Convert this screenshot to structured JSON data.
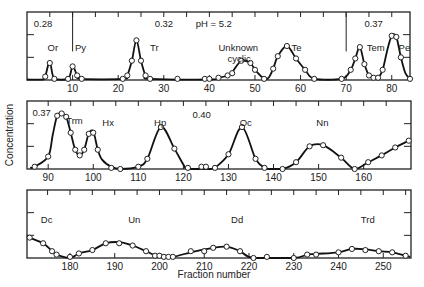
{
  "chart_data": {
    "type": "line",
    "title": "",
    "xlabel": "Fraction number",
    "ylabel": "Concentration",
    "grid": false,
    "panels": [
      {
        "xlim": [
          0,
          84
        ],
        "ylim": [
          0,
          3
        ],
        "box": {
          "x": 27,
          "y": 12,
          "w": 383,
          "h": 68
        },
        "xticks": [
          10,
          20,
          30,
          40,
          50,
          60,
          70,
          80
        ],
        "minor_ticks": [
          5,
          10,
          15,
          20,
          25,
          30,
          35,
          40,
          45,
          50,
          55,
          60,
          65,
          70,
          75,
          80
        ],
        "divider_lines": [
          {
            "x": 10,
            "label": "0.28",
            "label_x": 2
          },
          {
            "x": 70,
            "label": "0.37",
            "label_x": 72
          }
        ],
        "annotations": [
          {
            "text": "0.28",
            "x": 1.5,
            "y": 2.35
          },
          {
            "text": "0.32",
            "x": 28,
            "y": 2.35
          },
          {
            "text": "pH = 5.2",
            "x": 37,
            "y": 2.35
          },
          {
            "text": "Or",
            "x": 4.5,
            "y": 1.3
          },
          {
            "text": "Py",
            "x": 10.5,
            "y": 1.3
          },
          {
            "text": "Tr",
            "x": 27,
            "y": 1.3
          },
          {
            "text": "Unknown",
            "x": 42,
            "y": 1.3
          },
          {
            "text": "cyclic",
            "x": 44,
            "y": 0.8
          },
          {
            "text": "Te",
            "x": 58,
            "y": 1.3
          },
          {
            "text": "0.37",
            "x": 74,
            "y": 2.35
          },
          {
            "text": "Tem",
            "x": 74.5,
            "y": 1.3
          },
          {
            "text": "Pe",
            "x": 81.5,
            "y": 1.3
          }
        ],
        "points": [
          [
            4,
            0.15
          ],
          [
            5,
            0.75
          ],
          [
            6,
            0.05
          ],
          [
            9,
            0.05
          ],
          [
            10,
            0.6
          ],
          [
            11,
            0.2
          ],
          [
            12,
            0.05
          ],
          [
            21,
            0.05
          ],
          [
            22,
            0.2
          ],
          [
            23,
            0.85
          ],
          [
            24,
            1.75
          ],
          [
            25,
            0.85
          ],
          [
            26,
            0.2
          ],
          [
            27,
            0.05
          ],
          [
            33,
            0.05
          ],
          [
            39,
            0.05
          ],
          [
            40,
            0.05
          ],
          [
            42,
            0.1
          ],
          [
            44,
            0.2
          ],
          [
            45,
            0.3
          ],
          [
            47,
            0.85
          ],
          [
            49,
            0.75
          ],
          [
            50,
            0.45
          ],
          [
            52,
            0.05
          ],
          [
            54,
            0.5
          ],
          [
            55,
            1.05
          ],
          [
            57,
            1.5
          ],
          [
            59,
            0.95
          ],
          [
            61,
            0.45
          ],
          [
            63,
            0.05
          ],
          [
            69,
            0.05
          ],
          [
            71,
            0.45
          ],
          [
            72,
            0.95
          ],
          [
            73,
            1.45
          ],
          [
            74,
            0.7
          ],
          [
            75,
            0.2
          ],
          [
            76,
            0.1
          ],
          [
            77,
            0.1
          ],
          [
            78,
            0.45
          ],
          [
            80,
            1.95
          ],
          [
            81,
            1.9
          ],
          [
            82,
            1.0
          ],
          [
            84,
            0.05
          ]
        ],
        "curve": [
          [
            0,
            0.02
          ],
          [
            3.5,
            0.02
          ],
          [
            4,
            0.15
          ],
          [
            5,
            0.8
          ],
          [
            6,
            0.05
          ],
          [
            9,
            0.05
          ],
          [
            10,
            0.6
          ],
          [
            11,
            0.2
          ],
          [
            12,
            0.05
          ],
          [
            21,
            0.05
          ],
          [
            22,
            0.2
          ],
          [
            23,
            0.85
          ],
          [
            24,
            1.75
          ],
          [
            25,
            0.85
          ],
          [
            26,
            0.2
          ],
          [
            27,
            0.05
          ],
          [
            40,
            0.02
          ],
          [
            42,
            0.1
          ],
          [
            44,
            0.2
          ],
          [
            45,
            0.35
          ],
          [
            47,
            0.85
          ],
          [
            49,
            0.75
          ],
          [
            50,
            0.45
          ],
          [
            52,
            0.05
          ],
          [
            53,
            0.1
          ],
          [
            54,
            0.5
          ],
          [
            55,
            1.05
          ],
          [
            57,
            1.5
          ],
          [
            59,
            0.95
          ],
          [
            61,
            0.45
          ],
          [
            63,
            0.05
          ],
          [
            69,
            0.05
          ],
          [
            71,
            0.45
          ],
          [
            72,
            0.95
          ],
          [
            73,
            1.45
          ],
          [
            74,
            0.7
          ],
          [
            75,
            0.2
          ],
          [
            76,
            0.1
          ],
          [
            77,
            0.1
          ],
          [
            78,
            0.45
          ],
          [
            79,
            1.3
          ],
          [
            80,
            1.95
          ],
          [
            81,
            1.9
          ],
          [
            82,
            1.0
          ],
          [
            83,
            0.3
          ],
          [
            84,
            0.05
          ]
        ]
      },
      {
        "xlim": [
          85.3,
          170.5
        ],
        "ylim": [
          0,
          3
        ],
        "box": {
          "x": 27,
          "y": 101,
          "w": 384,
          "h": 68
        },
        "xticks": [
          90,
          100,
          110,
          120,
          130,
          140,
          150,
          160
        ],
        "minor_ticks": [
          90,
          95,
          100,
          105,
          110,
          115,
          120,
          125,
          130,
          135,
          140,
          145,
          150,
          155,
          160,
          165
        ],
        "divider_lines": [],
        "annotations": [
          {
            "text": "0.37",
            "x": 86.5,
            "y": 2.35
          },
          {
            "text": "Trm",
            "x": 94,
            "y": 2.0
          },
          {
            "text": "Hx",
            "x": 102,
            "y": 1.9
          },
          {
            "text": "Hp",
            "x": 113.5,
            "y": 1.9
          },
          {
            "text": "0.40",
            "x": 122,
            "y": 2.25
          },
          {
            "text": "Oc",
            "x": 132.5,
            "y": 1.9
          },
          {
            "text": "Nn",
            "x": 149.5,
            "y": 1.9
          }
        ],
        "points": [
          [
            87,
            0.1
          ],
          [
            90,
            0.55
          ],
          [
            92,
            2.35
          ],
          [
            93,
            2.45
          ],
          [
            94,
            2.3
          ],
          [
            95,
            1.6
          ],
          [
            96,
            0.85
          ],
          [
            97,
            0.6
          ],
          [
            98,
            0.85
          ],
          [
            99,
            1.55
          ],
          [
            100,
            1.6
          ],
          [
            101,
            0.85
          ],
          [
            104,
            0.05
          ],
          [
            106,
            0.0
          ],
          [
            110,
            0.1
          ],
          [
            112,
            0.45
          ],
          [
            115,
            1.85
          ],
          [
            118,
            0.9
          ],
          [
            121,
            0.05
          ],
          [
            124,
            0.1
          ],
          [
            125,
            0.1
          ],
          [
            127,
            0.05
          ],
          [
            130,
            0.65
          ],
          [
            133,
            1.85
          ],
          [
            136,
            0.45
          ],
          [
            138,
            0.05
          ],
          [
            142,
            0.0
          ],
          [
            145,
            0.3
          ],
          [
            148,
            1.0
          ],
          [
            151,
            1.05
          ],
          [
            155,
            0.5
          ],
          [
            158,
            0.0
          ],
          [
            161,
            0.3
          ],
          [
            164,
            0.6
          ],
          [
            167,
            0.95
          ],
          [
            170,
            1.25
          ]
        ],
        "curve": [
          [
            86,
            0.05
          ],
          [
            87,
            0.1
          ],
          [
            90,
            0.55
          ],
          [
            91,
            1.5
          ],
          [
            92,
            2.35
          ],
          [
            93,
            2.45
          ],
          [
            94,
            2.3
          ],
          [
            95,
            1.6
          ],
          [
            96,
            0.85
          ],
          [
            97,
            0.6
          ],
          [
            98,
            0.85
          ],
          [
            99,
            1.55
          ],
          [
            100,
            1.65
          ],
          [
            101,
            0.85
          ],
          [
            102,
            0.4
          ],
          [
            104,
            0.1
          ],
          [
            106,
            0.0
          ],
          [
            110,
            0.1
          ],
          [
            112,
            0.45
          ],
          [
            115,
            1.85
          ],
          [
            118,
            0.9
          ],
          [
            120,
            0.2
          ],
          [
            121,
            0.0
          ],
          [
            126,
            0.0
          ],
          [
            127,
            0.05
          ],
          [
            130,
            0.65
          ],
          [
            133,
            1.85
          ],
          [
            136,
            0.45
          ],
          [
            138,
            0.05
          ],
          [
            139,
            0.0
          ],
          [
            142,
            0.0
          ],
          [
            145,
            0.3
          ],
          [
            148,
            1.0
          ],
          [
            151,
            1.05
          ],
          [
            155,
            0.5
          ],
          [
            158,
            0.0
          ],
          [
            161,
            0.3
          ],
          [
            164,
            0.6
          ],
          [
            167,
            0.95
          ],
          [
            170,
            1.25
          ]
        ]
      },
      {
        "xlim": [
          170.4,
          256.2
        ],
        "ylim": [
          0,
          3
        ],
        "box": {
          "x": 27,
          "y": 190,
          "w": 384,
          "h": 68
        },
        "xticks": [
          180,
          190,
          200,
          210,
          220,
          230,
          240,
          250
        ],
        "minor_ticks": [
          175,
          180,
          185,
          190,
          195,
          200,
          205,
          210,
          215,
          220,
          225,
          230,
          235,
          240,
          245,
          250,
          255
        ],
        "divider_lines": [],
        "annotations": [
          {
            "text": "Dc",
            "x": 173.5,
            "y": 1.55
          },
          {
            "text": "Un",
            "x": 193,
            "y": 1.55
          },
          {
            "text": "Dd",
            "x": 216,
            "y": 1.55
          },
          {
            "text": "Trd",
            "x": 245,
            "y": 1.55
          }
        ],
        "points": [
          [
            171,
            0.9
          ],
          [
            174,
            0.65
          ],
          [
            176,
            0.3
          ],
          [
            177,
            0.15
          ],
          [
            180,
            0.05
          ],
          [
            182,
            0.2
          ],
          [
            185,
            0.35
          ],
          [
            188,
            0.65
          ],
          [
            191,
            0.65
          ],
          [
            194,
            0.55
          ],
          [
            197,
            0.3
          ],
          [
            199,
            0.1
          ],
          [
            200,
            0.1
          ],
          [
            201,
            0.05
          ],
          [
            202,
            0.05
          ],
          [
            203,
            0.05
          ],
          [
            207,
            0.3
          ],
          [
            210,
            0.3
          ],
          [
            212,
            0.45
          ],
          [
            215,
            0.5
          ],
          [
            218,
            0.3
          ],
          [
            221,
            0.0
          ],
          [
            224,
            0.05
          ],
          [
            230,
            0.0
          ],
          [
            233,
            0.15
          ],
          [
            235,
            0.15
          ],
          [
            240,
            0.25
          ],
          [
            243,
            0.4
          ],
          [
            246,
            0.35
          ],
          [
            249,
            0.3
          ],
          [
            252,
            0.25
          ],
          [
            255,
            0.1
          ]
        ],
        "curve": [
          [
            170.4,
            1.0
          ],
          [
            171,
            0.9
          ],
          [
            174,
            0.65
          ],
          [
            176,
            0.3
          ],
          [
            177,
            0.15
          ],
          [
            180,
            0.0
          ],
          [
            182,
            0.2
          ],
          [
            185,
            0.35
          ],
          [
            188,
            0.65
          ],
          [
            191,
            0.7
          ],
          [
            194,
            0.55
          ],
          [
            197,
            0.3
          ],
          [
            199,
            0.12
          ],
          [
            201,
            0.05
          ],
          [
            203,
            0.05
          ],
          [
            207,
            0.25
          ],
          [
            210,
            0.38
          ],
          [
            212,
            0.45
          ],
          [
            215,
            0.5
          ],
          [
            218,
            0.3
          ],
          [
            221,
            0.0
          ],
          [
            230,
            0.0
          ],
          [
            233,
            0.15
          ],
          [
            235,
            0.18
          ],
          [
            240,
            0.25
          ],
          [
            243,
            0.4
          ],
          [
            246,
            0.38
          ],
          [
            249,
            0.3
          ],
          [
            252,
            0.25
          ],
          [
            255,
            0.1
          ],
          [
            256,
            0.05
          ]
        ]
      }
    ]
  }
}
